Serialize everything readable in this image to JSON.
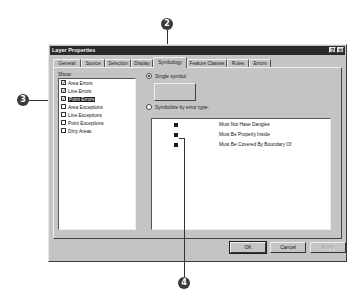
{
  "dialog": {
    "title": "Layer Properties",
    "title_buttons": [
      {
        "name": "help",
        "glyph": "?"
      },
      {
        "name": "close",
        "glyph": "×"
      }
    ],
    "tabs": [
      {
        "label": "General",
        "active": false
      },
      {
        "label": "Source",
        "active": false
      },
      {
        "label": "Selection",
        "active": false
      },
      {
        "label": "Display",
        "active": false
      },
      {
        "label": "Symbology",
        "active": true
      },
      {
        "label": "Feature Classes",
        "active": false
      },
      {
        "label": "Rules",
        "active": false
      },
      {
        "label": "Errors",
        "active": false
      }
    ],
    "show": {
      "label": "Show:",
      "items": [
        {
          "label": "Area Errors",
          "checked": true,
          "selected": false
        },
        {
          "label": "Line Errors",
          "checked": true,
          "selected": false
        },
        {
          "label": "Point Errors",
          "checked": true,
          "selected": true
        },
        {
          "label": "Area Exceptions",
          "checked": false,
          "selected": false
        },
        {
          "label": "Line Exceptions",
          "checked": false,
          "selected": false
        },
        {
          "label": "Point Exceptions",
          "checked": false,
          "selected": false
        },
        {
          "label": "Dirty Areas",
          "checked": false,
          "selected": false
        }
      ]
    },
    "symbology": {
      "single_symbol_label": "Single symbol",
      "single_symbol_selected": true,
      "by_error_type_label": "Symbolize by error type:",
      "by_error_type_selected": false,
      "error_types": [
        {
          "label": "Must Not Have Dangles"
        },
        {
          "label": "Must Be Properly Inside"
        },
        {
          "label": "Must Be Covered By Boundary Of"
        }
      ]
    },
    "buttons": {
      "ok": "OK",
      "cancel": "Cancel",
      "apply": "Apply"
    }
  },
  "callouts": [
    "2",
    "3",
    "4"
  ]
}
